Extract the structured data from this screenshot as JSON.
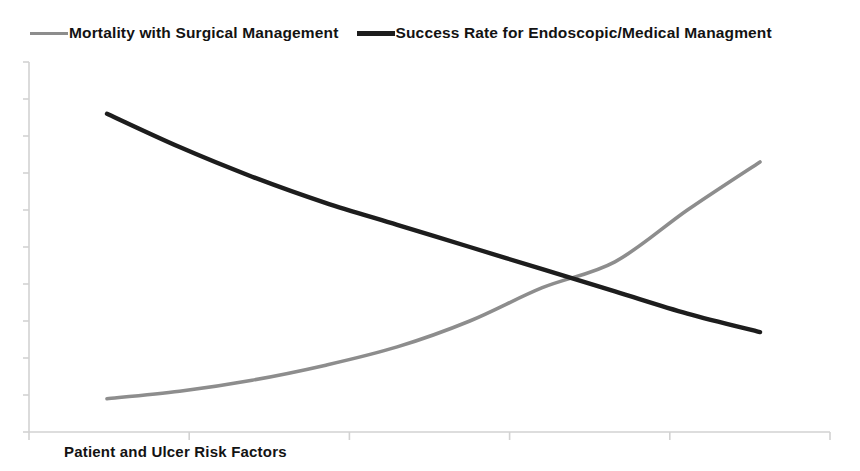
{
  "chart_data": {
    "type": "line",
    "title": "",
    "subtitle": "",
    "xlabel": "Patient and Ulcer Risk Factors",
    "ylabel": "",
    "grid": false,
    "legend_position": "top",
    "axis_tick_labels_shown": false,
    "xlim": [
      0,
      5
    ],
    "ylim": [
      0,
      10
    ],
    "x_tick_count": 6,
    "y_tick_count": 11,
    "x": [
      0,
      0.5,
      1,
      1.5,
      2,
      2.5,
      3,
      3.5,
      4,
      4.5
    ],
    "series": [
      {
        "name": "Mortality with Surgical Management",
        "color": "#8d8d8d",
        "values": [
          0.9,
          1.1,
          1.4,
          1.8,
          2.3,
          3.0,
          3.9,
          4.6,
          6.0,
          7.3
        ]
      },
      {
        "name": "Success Rate for Endoscopic/Medical Managment",
        "color": "#1d1d1d",
        "values": [
          8.6,
          7.7,
          6.9,
          6.2,
          5.6,
          5.0,
          4.4,
          3.8,
          3.2,
          2.7
        ]
      }
    ],
    "annotations": [
      "Curves cross near the middle of the x-range"
    ]
  },
  "legend": {
    "entries": [
      {
        "label": "Mortality with Surgical Management",
        "swatch": "gray-line-swatch"
      },
      {
        "label": "Success Rate for Endoscopic/Medical Managment",
        "swatch": "black-line-swatch"
      }
    ]
  },
  "axes": {
    "x_title": "Patient and Ulcer Risk Factors",
    "y_title": ""
  },
  "colors": {
    "series_mortality": "#8d8d8d",
    "series_success": "#1d1d1d",
    "axis": "#d2d2d2",
    "text": "#131313",
    "background": "#ffffff"
  }
}
